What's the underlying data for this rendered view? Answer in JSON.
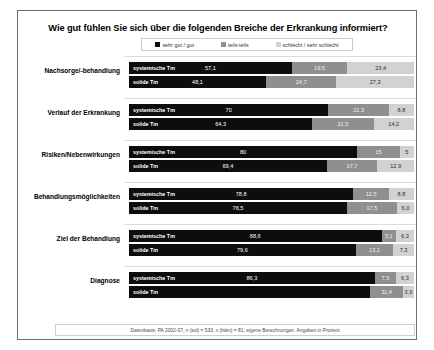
{
  "chart_data": {
    "type": "bar",
    "orientation": "horizontal",
    "stacked": true,
    "title": "Wie gut fühlen Sie sich über die folgenden Breiche der Erkrankung informiert?",
    "xlabel": "",
    "ylabel": "",
    "xlim": [
      0,
      100
    ],
    "grid": false,
    "legend_position": "top-center",
    "units": "Prozent",
    "legend": [
      "sehr gut / gut",
      "teils-teils",
      "schlecht / sehr schlecht"
    ],
    "legend_colors": [
      "#0d0d0d",
      "#8f8f8f",
      "#d2d2d2"
    ],
    "series": [
      {
        "name": "sehr gut / gut",
        "color": "#0d0d0d"
      },
      {
        "name": "teils-teils",
        "color": "#8f8f8f"
      },
      {
        "name": "schlecht / sehr schlecht",
        "color": "#d2d2d2"
      }
    ],
    "categories": [
      "Nachsorge/-behandlung",
      "Verlauf der Erkrankung",
      "Risiken/Nebenwirkungen",
      "Behandlungsmöglichkeiten",
      "Ziel der Behandlung",
      "Diagnose"
    ],
    "subgroups": [
      "systemische Tm",
      "solide Tm"
    ],
    "groups": [
      {
        "label": "Nachsorge/-behandlung",
        "rows": [
          {
            "name": "systemische Tm",
            "values": [
              57.1,
              19.5,
              23.4
            ],
            "labels": [
              "57,1",
              "19,5",
              "23,4"
            ]
          },
          {
            "name": "solide Tm",
            "values": [
              48.1,
              24.7,
              27.3
            ],
            "labels": [
              "48,1",
              "24,7",
              "27,3"
            ]
          }
        ]
      },
      {
        "label": "Verlauf der Erkrankung",
        "rows": [
          {
            "name": "systemische Tm",
            "values": [
              70.0,
              21.3,
              8.8
            ],
            "labels": [
              "70",
              "21,3",
              "8,8"
            ]
          },
          {
            "name": "solide Tm",
            "values": [
              64.3,
              21.5,
              14.2
            ],
            "labels": [
              "64,3",
              "21,5",
              "14,2"
            ]
          }
        ]
      },
      {
        "label": "Risiken/Nebenwirkungen",
        "rows": [
          {
            "name": "systemische Tm",
            "values": [
              80.0,
              15.0,
              5.0
            ],
            "labels": [
              "80",
              "15",
              "5"
            ]
          },
          {
            "name": "solide Tm",
            "values": [
              69.4,
              17.7,
              12.9
            ],
            "labels": [
              "69,4",
              "17,7",
              "12,9"
            ]
          }
        ]
      },
      {
        "label": "Behandlungsmöglichkeiten",
        "rows": [
          {
            "name": "systemische Tm",
            "values": [
              78.8,
              12.5,
              8.8
            ],
            "labels": [
              "78,8",
              "12,5",
              "8,8"
            ]
          },
          {
            "name": "solide Tm",
            "values": [
              76.5,
              17.5,
              6.0
            ],
            "labels": [
              "76,5",
              "17,5",
              "6,0"
            ]
          }
        ]
      },
      {
        "label": "Ziel der Behandlung",
        "rows": [
          {
            "name": "systemische Tm",
            "values": [
              88.6,
              5.1,
              6.3
            ],
            "labels": [
              "88,6",
              "5,1",
              "6,3"
            ]
          },
          {
            "name": "solide Tm",
            "values": [
              79.6,
              13.1,
              7.3
            ],
            "labels": [
              "79,6",
              "13,1",
              "7,3"
            ]
          }
        ]
      },
      {
        "label": "Diagnose",
        "rows": [
          {
            "name": "systemische Tm",
            "values": [
              86.3,
              7.5,
              6.3
            ],
            "labels": [
              "86,3",
              "7,5",
              "6,3"
            ]
          },
          {
            "name": "solide Tm",
            "values": [
              84.7,
              11.4,
              3.9
            ],
            "labels": [
              "",
              "11,4",
              "3,9"
            ]
          }
        ]
      }
    ],
    "footnote": "Datenbasis: PA 2002-07, n (sol) = 533, n (häm) = 81; eigene Berechnungen. Angaben in Prozent"
  }
}
